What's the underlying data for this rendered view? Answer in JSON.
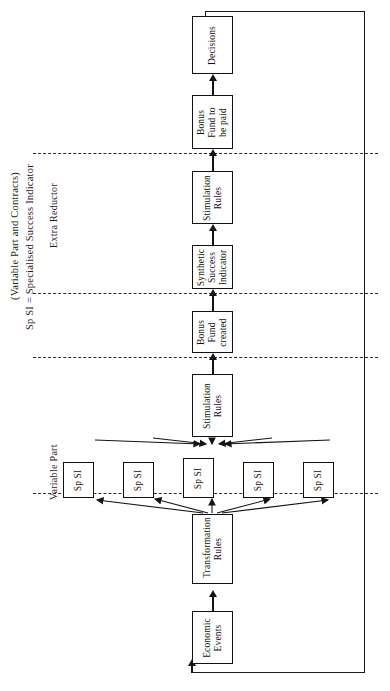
{
  "figure": {
    "orientation": "rotated-90-ccw",
    "legend": {
      "line1": "(Variable Part and Contracts)",
      "line2": "Sp SI = Specialised Success Indicator"
    },
    "regions": [
      {
        "id": "extra-reductor",
        "label": "Extra Reductor"
      },
      {
        "id": "variable-part",
        "label": "Variable Part"
      }
    ],
    "dividers_y": [
      153,
      293,
      357,
      493
    ],
    "colors": {
      "line": "#141414",
      "box_border": "#111111",
      "background": "#ffffff",
      "divider": "#2a2a2a"
    },
    "nodes": [
      {
        "id": "decisions",
        "label": "Decisions"
      },
      {
        "id": "bonus-fund-paid",
        "label": "Bonus Fund to be paid"
      },
      {
        "id": "stim-rules-upper",
        "label": "Stimulation Rules"
      },
      {
        "id": "synthetic-si",
        "label": "Synthetic Success Indicator"
      },
      {
        "id": "bonus-fund-created",
        "label": "Bonus Fund created"
      },
      {
        "id": "stim-rules-lower",
        "label": "Stimulation Rules"
      },
      {
        "id": "sp-si-1",
        "label": "Sp SI"
      },
      {
        "id": "sp-si-2",
        "label": "Sp SI"
      },
      {
        "id": "sp-si-3",
        "label": "Sp SI"
      },
      {
        "id": "sp-si-4",
        "label": "Sp SI"
      },
      {
        "id": "sp-si-5",
        "label": "Sp SI"
      },
      {
        "id": "transformation-rules",
        "label": "Transformation Rules"
      },
      {
        "id": "economic-events",
        "label": "Economic Events"
      }
    ],
    "feedback_loop": {
      "from": "decisions",
      "to": "economic-events"
    }
  }
}
